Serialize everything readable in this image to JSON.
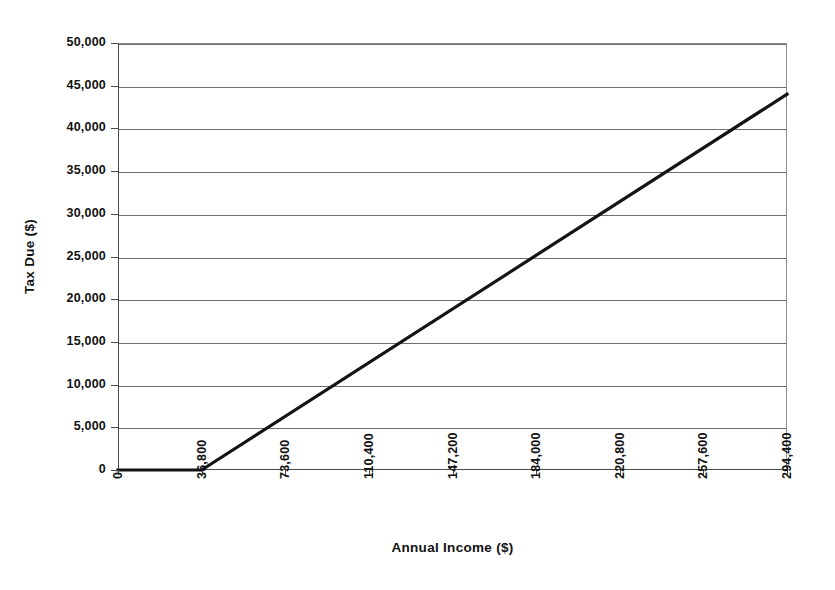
{
  "chart_data": {
    "type": "line",
    "title": "",
    "xlabel": "Annual Income ($)",
    "ylabel": "Tax Due ($)",
    "xlim": [
      0,
      294400
    ],
    "ylim": [
      0,
      50000
    ],
    "grid": true,
    "legend": false,
    "x_tick_labels": [
      "0",
      "36,800",
      "73,600",
      "110,400",
      "147,200",
      "184,000",
      "220,800",
      "257,600",
      "294,400"
    ],
    "x_ticks": [
      0,
      36800,
      73600,
      110400,
      147200,
      184000,
      220800,
      257600,
      294400
    ],
    "y_tick_labels": [
      "0",
      "5,000",
      "10,000",
      "15,000",
      "20,000",
      "25,000",
      "30,000",
      "35,000",
      "40,000",
      "45,000",
      "50,000"
    ],
    "y_ticks": [
      0,
      5000,
      10000,
      15000,
      20000,
      25000,
      30000,
      35000,
      40000,
      45000,
      50000
    ],
    "series": [
      {
        "name": "Tax Due",
        "color": "#141414",
        "x": [
          0,
          36800,
          294400
        ],
        "values": [
          0,
          0,
          44000
        ]
      }
    ]
  },
  "style": {
    "line_color": "#141414",
    "grid_color": "#6f6f6f",
    "axis_color": "#4a4a4a",
    "background": "#ffffff",
    "line_width": 3.2
  }
}
